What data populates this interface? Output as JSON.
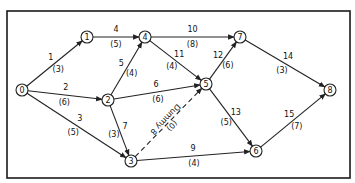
{
  "diagram": {
    "type": "activity-on-arrow network",
    "nodes": [
      {
        "id": "0",
        "label": "0",
        "x": 22,
        "y": 90
      },
      {
        "id": "1",
        "label": "1",
        "x": 87,
        "y": 37
      },
      {
        "id": "2",
        "label": "2",
        "x": 108,
        "y": 100
      },
      {
        "id": "3",
        "label": "3",
        "x": 131,
        "y": 161
      },
      {
        "id": "4",
        "label": "4",
        "x": 145,
        "y": 37
      },
      {
        "id": "5",
        "label": "5",
        "x": 206,
        "y": 84
      },
      {
        "id": "6",
        "label": "6",
        "x": 256,
        "y": 151
      },
      {
        "id": "7",
        "label": "7",
        "x": 240,
        "y": 37
      },
      {
        "id": "8",
        "label": "8",
        "x": 330,
        "y": 90
      }
    ],
    "edges": [
      {
        "activity": "1",
        "duration": "(3)",
        "from": "0",
        "to": "1",
        "dummy": false
      },
      {
        "activity": "2",
        "duration": "(6)",
        "from": "0",
        "to": "2",
        "dummy": false
      },
      {
        "activity": "3",
        "duration": "(5)",
        "from": "0",
        "to": "3",
        "dummy": false
      },
      {
        "activity": "4",
        "duration": "(5)",
        "from": "1",
        "to": "4",
        "dummy": false
      },
      {
        "activity": "5",
        "duration": "(4)",
        "from": "2",
        "to": "4",
        "dummy": false
      },
      {
        "activity": "6",
        "duration": "(6)",
        "from": "2",
        "to": "5",
        "dummy": false
      },
      {
        "activity": "7",
        "duration": "(3)",
        "from": "2",
        "to": "3",
        "dummy": false
      },
      {
        "activity": "Dummy 8",
        "duration": "(0)",
        "from": "3",
        "to": "5",
        "dummy": true
      },
      {
        "activity": "9",
        "duration": "(4)",
        "from": "3",
        "to": "6",
        "dummy": false
      },
      {
        "activity": "10",
        "duration": "(8)",
        "from": "4",
        "to": "7",
        "dummy": false
      },
      {
        "activity": "11",
        "duration": "(4)",
        "from": "4",
        "to": "5",
        "dummy": false
      },
      {
        "activity": "12",
        "duration": "(6)",
        "from": "5",
        "to": "7",
        "dummy": false
      },
      {
        "activity": "13",
        "duration": "(5)",
        "from": "5",
        "to": "6",
        "dummy": false
      },
      {
        "activity": "14",
        "duration": "(3)",
        "from": "7",
        "to": "8",
        "dummy": false
      },
      {
        "activity": "15",
        "duration": "(7)",
        "from": "6",
        "to": "8",
        "dummy": false
      }
    ]
  }
}
